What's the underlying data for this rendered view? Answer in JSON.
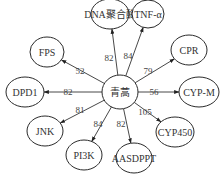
{
  "diagram": {
    "center": {
      "label": "青蒿",
      "x": 120,
      "y": 92,
      "rx": 18,
      "ry": 17
    },
    "nodes": [
      {
        "id": "dna",
        "label": "DNA聚合酶",
        "x": 110,
        "y": 14,
        "rx": 19,
        "ry": 15,
        "weight": "82",
        "lx": 109,
        "ly": 58
      },
      {
        "id": "tnf",
        "label": "TNF-α",
        "x": 148,
        "y": 14,
        "rx": 16,
        "ry": 14,
        "weight": "84",
        "lx": 128,
        "ly": 56
      },
      {
        "id": "fps",
        "label": "FPS",
        "x": 47,
        "y": 52,
        "rx": 17,
        "ry": 15,
        "weight": "52",
        "lx": 80,
        "ly": 71
      },
      {
        "id": "cpr",
        "label": "CPR",
        "x": 189,
        "y": 50,
        "rx": 18,
        "ry": 15,
        "weight": "79",
        "lx": 148,
        "ly": 71
      },
      {
        "id": "dpd1",
        "label": "DPD1",
        "x": 25,
        "y": 92,
        "rx": 19,
        "ry": 15,
        "weight": "82",
        "lx": 68,
        "ly": 92
      },
      {
        "id": "cypm",
        "label": "CYP-M",
        "x": 199,
        "y": 92,
        "rx": 20,
        "ry": 15,
        "weight": "56",
        "lx": 154,
        "ly": 92
      },
      {
        "id": "jnk",
        "label": "JNK",
        "x": 45,
        "y": 131,
        "rx": 18,
        "ry": 15,
        "weight": "81",
        "lx": 80,
        "ly": 110
      },
      {
        "id": "cyp450",
        "label": "CYP450",
        "x": 175,
        "y": 132,
        "rx": 19,
        "ry": 15,
        "weight": "105",
        "lx": 145,
        "ly": 112
      },
      {
        "id": "pi3k",
        "label": "PI3K",
        "x": 84,
        "y": 155,
        "rx": 18,
        "ry": 15,
        "weight": "84",
        "lx": 98,
        "ly": 124
      },
      {
        "id": "aasdppt",
        "label": "AASDPPT",
        "x": 134,
        "y": 158,
        "rx": 18,
        "ry": 15,
        "weight": "82",
        "lx": 121,
        "ly": 124
      }
    ]
  }
}
